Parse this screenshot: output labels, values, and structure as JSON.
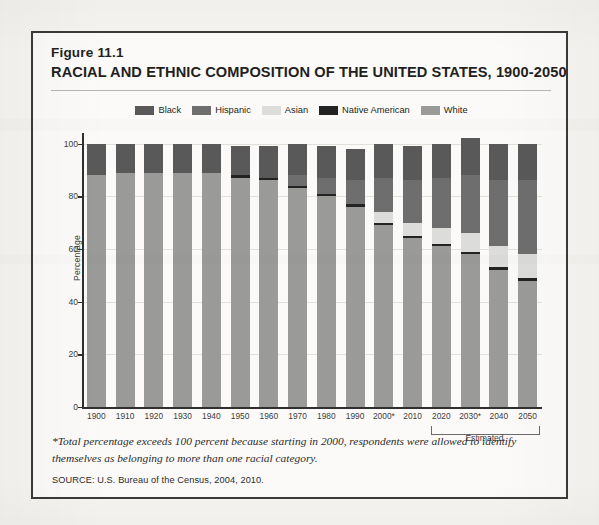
{
  "figure": {
    "label": "Figure 11.1",
    "title": "RACIAL AND ETHNIC COMPOSITION OF THE UNITED STATES, 1900-2050"
  },
  "footnote": "*Total percentage exceeds 100 percent because starting in 2000, respondents were allowed to identify themselves as belonging to more than one racial category.",
  "source": "SOURCE: U.S. Bureau of the Census, 2004, 2010.",
  "estimated_bracket_label": "Estimated",
  "colors": {
    "black": "#595959",
    "hispanic": "#6e6e6e",
    "asian": "#dcdcda",
    "native_american": "#232323",
    "white": "#9a9a98",
    "axis": "#2f2f2f",
    "grid": "#e2e0db",
    "frame": "#3a3a3a",
    "page_background": "#f5f4f1",
    "figure_background": "#fbfaf8"
  },
  "chart_data": {
    "type": "bar",
    "subtype": "stacked-vertical",
    "title": "RACIAL AND ETHNIC COMPOSITION OF THE UNITED STATES, 1900-2050",
    "xlabel": "",
    "ylabel": "Percentage",
    "ylim": [
      0,
      100
    ],
    "yticks": [
      0,
      20,
      40,
      60,
      80,
      100
    ],
    "grid": true,
    "legend_position": "top-center",
    "stack_order_bottom_to_top": [
      "White",
      "Native American",
      "Asian",
      "Hispanic",
      "Black"
    ],
    "categories": [
      "1900",
      "1910",
      "1920",
      "1930",
      "1940",
      "1950",
      "1960",
      "1970",
      "1980",
      "1990",
      "2000*",
      "2010",
      "2020",
      "2030*",
      "2040",
      "2050"
    ],
    "series": [
      {
        "name": "White",
        "color": "#9a9a98",
        "values": [
          88,
          89,
          89,
          89,
          89,
          87,
          86,
          83,
          80,
          76,
          69,
          64,
          61,
          58,
          52,
          48
        ]
      },
      {
        "name": "Native American",
        "color": "#232323",
        "values": [
          0,
          0,
          0,
          0,
          0,
          1,
          1,
          1,
          1,
          1,
          1,
          1,
          1,
          1,
          1,
          1
        ]
      },
      {
        "name": "Asian",
        "color": "#dcdcda",
        "values": [
          0,
          0,
          0,
          0,
          0,
          0,
          0,
          0,
          0,
          0,
          4,
          5,
          6,
          7,
          8,
          9
        ]
      },
      {
        "name": "Hispanic",
        "color": "#6e6e6e",
        "values": [
          0,
          0,
          0,
          0,
          0,
          0,
          0,
          4,
          6,
          9,
          13,
          16,
          19,
          22,
          25,
          28
        ]
      },
      {
        "name": "Black",
        "color": "#595959",
        "values": [
          12,
          11,
          11,
          11,
          11,
          11,
          12,
          12,
          12,
          12,
          13,
          13,
          13,
          14,
          14,
          14
        ]
      }
    ],
    "totals": [
      100,
      100,
      100,
      100,
      100,
      99,
      99,
      100,
      99,
      98,
      100,
      99,
      100,
      102,
      100,
      100
    ],
    "annotations": [
      {
        "text": "Estimated",
        "applies_to": [
          "2020",
          "2030*",
          "2040",
          "2050"
        ]
      }
    ]
  },
  "legend": {
    "items": [
      {
        "label": "Black",
        "swatch": "#595959",
        "icon": "legend-swatch"
      },
      {
        "label": "Hispanic",
        "swatch": "#6e6e6e",
        "icon": "legend-swatch"
      },
      {
        "label": "Asian",
        "swatch": "#dcdcda",
        "icon": "legend-swatch"
      },
      {
        "label": "Native American",
        "swatch": "#232323",
        "icon": "legend-swatch"
      },
      {
        "label": "White",
        "swatch": "#9a9a98",
        "icon": "legend-swatch"
      }
    ]
  }
}
